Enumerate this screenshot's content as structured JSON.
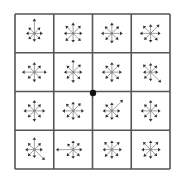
{
  "figure": {
    "type": "descriptor-grid",
    "grid": {
      "rows": 4,
      "cols": 4,
      "x0": 15,
      "y0": 14,
      "cell": 38.75
    },
    "colors": {
      "line": "#555555",
      "arrow": "#8a8a8a",
      "head": "#333333",
      "center_dot": "#111111",
      "bg": "#ffffff"
    },
    "center_dot": {
      "x": 93,
      "y": 93,
      "r": 3.2
    },
    "directions_deg": [
      0,
      45,
      90,
      135,
      180,
      225,
      270,
      315
    ],
    "cells": [
      [
        [
          0.45,
          0.45,
          0.85,
          0.45,
          0.45,
          0.45,
          0.45,
          0.45
        ],
        [
          0.5,
          0.6,
          0.6,
          0.6,
          0.5,
          0.6,
          0.5,
          0.6
        ],
        [
          0.6,
          0.55,
          0.6,
          0.55,
          0.6,
          0.5,
          0.55,
          0.5
        ],
        [
          0.55,
          0.7,
          0.5,
          0.6,
          0.6,
          0.5,
          0.5,
          0.55
        ]
      ],
      [
        [
          0.7,
          0.5,
          0.55,
          0.5,
          0.7,
          0.5,
          0.55,
          0.5
        ],
        [
          0.5,
          0.6,
          0.7,
          0.5,
          0.5,
          0.5,
          0.6,
          0.55
        ],
        [
          0.55,
          0.6,
          0.55,
          0.5,
          0.55,
          0.5,
          0.55,
          0.55
        ],
        [
          0.4,
          0.5,
          0.5,
          0.6,
          0.4,
          0.5,
          0.5,
          0.85
        ]
      ],
      [
        [
          0.6,
          0.5,
          0.6,
          0.5,
          0.6,
          0.5,
          0.6,
          0.5
        ],
        [
          0.6,
          0.6,
          0.5,
          0.55,
          0.6,
          0.5,
          0.5,
          0.55
        ],
        [
          0.45,
          0.9,
          0.45,
          0.5,
          0.5,
          0.5,
          0.5,
          0.5
        ],
        [
          0.55,
          0.5,
          0.6,
          0.5,
          0.55,
          0.5,
          0.6,
          0.5
        ]
      ],
      [
        [
          0.45,
          0.5,
          0.7,
          0.5,
          0.5,
          0.5,
          0.45,
          0.85
        ],
        [
          0.5,
          0.5,
          0.5,
          0.45,
          1.0,
          0.5,
          0.5,
          0.5
        ],
        [
          0.55,
          0.6,
          0.5,
          0.6,
          0.5,
          0.55,
          0.5,
          0.5
        ],
        [
          0.55,
          0.6,
          0.5,
          0.6,
          0.5,
          0.55,
          0.5,
          0.5
        ]
      ]
    ],
    "max_arrow_len": 16
  }
}
